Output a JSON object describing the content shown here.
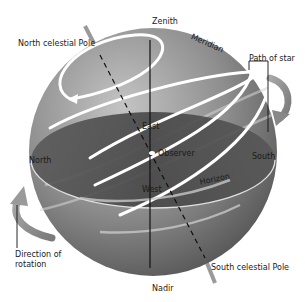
{
  "diagram": {
    "type": "celestial-sphere",
    "colors": {
      "background": "#ffffff",
      "sphere_light": "#b5b5b5",
      "sphere_dark": "#5e5e5e",
      "horizon_plane": "#4a4a4a",
      "star_path": "#ffffff",
      "arrow": "#8c8c8c",
      "text": "#1a1a1a"
    }
  },
  "labels": {
    "zenith": "Zenith",
    "meridian": "Meridian",
    "north_celestial_pole": "North celestial Pole",
    "path_of_star": "Path of star",
    "east": "East",
    "observer": "Observer",
    "north": "North",
    "south": "South",
    "horizon": "Horizon",
    "west": "West",
    "direction_of_rotation": "Direction of rotation",
    "south_celestial_pole": "South celestial Pole",
    "nadir": "Nadir"
  }
}
